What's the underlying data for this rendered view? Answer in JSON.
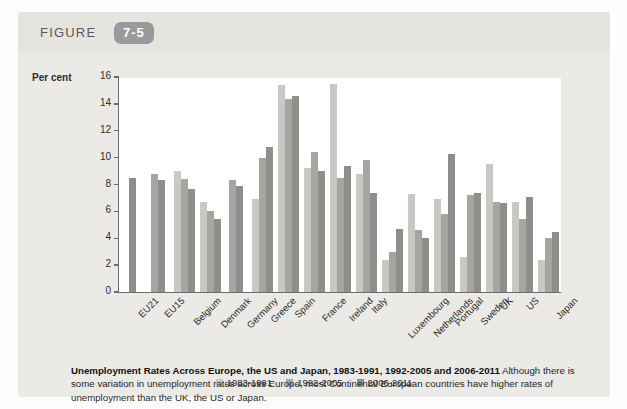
{
  "figure": {
    "label": "FIGURE",
    "number": "7-5"
  },
  "chart_data": {
    "type": "bar",
    "title": "Unemployment Rates Across Europe, the US and Japan, 1983-1991, 1992-2005 and 2006-2011",
    "xlabel": "",
    "ylabel": "Per cent",
    "ylim": [
      0,
      16
    ],
    "yticks": [
      0,
      2,
      4,
      6,
      8,
      10,
      12,
      14,
      16
    ],
    "ytick_labels": [
      "0",
      "2",
      "4",
      "6",
      "8",
      "10",
      "12",
      "14",
      "16"
    ],
    "grid": false,
    "legend_position": "bottom-center",
    "categories": [
      "EU21",
      "EU15",
      "Belgium",
      "Denmark",
      "Germany",
      "Greece",
      "Spain",
      "France",
      "Ireland",
      "Italy",
      "Luxembourg",
      "Netherlands",
      "Portugal",
      "Sweden",
      "UK",
      "US",
      "Japan"
    ],
    "series": [
      {
        "name": "1983-1991",
        "color": "#c9c8c4",
        "values": [
          null,
          null,
          9.0,
          6.7,
          null,
          6.9,
          15.4,
          9.2,
          15.5,
          8.8,
          2.4,
          7.3,
          6.9,
          2.6,
          9.5,
          6.7,
          2.4
        ]
      },
      {
        "name": "1992-2005",
        "color": "#a5a5a2",
        "values": [
          null,
          8.8,
          8.4,
          6.0,
          8.3,
          10.0,
          14.4,
          10.4,
          8.5,
          9.8,
          3.0,
          4.6,
          5.8,
          7.2,
          6.7,
          5.4,
          4.0
        ]
      },
      {
        "name": "2006-2011",
        "color": "#8e8e8b",
        "values": [
          8.5,
          8.3,
          7.7,
          5.4,
          7.9,
          10.8,
          14.6,
          9.0,
          9.4,
          7.4,
          4.7,
          4.0,
          10.3,
          7.4,
          6.6,
          7.1,
          4.5
        ]
      }
    ]
  },
  "caption": {
    "bold_lead": "Unemployment Rates Across Europe, the US and Japan, 1983-1991, 1992-2005 and 2006-2011",
    "body": "Although there is some variation in unemployment rates across Europe, most Continental European countries have higher rates of unemployment than the UK, the US or Japan."
  }
}
